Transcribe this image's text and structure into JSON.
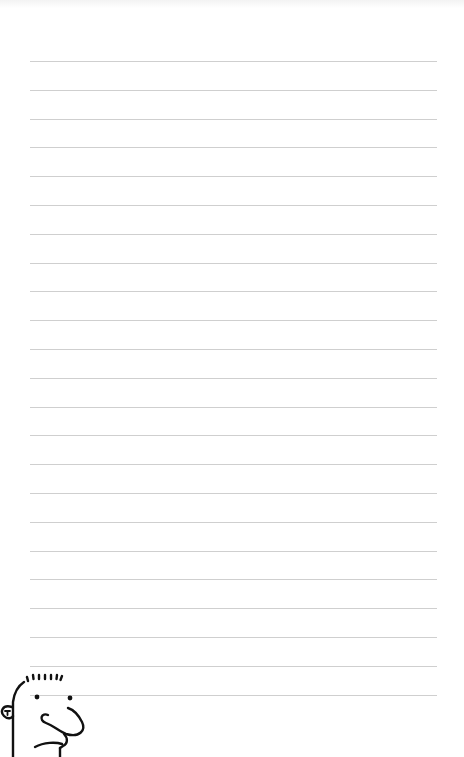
{
  "page": {
    "type": "ruled-notebook-page",
    "background_color": "#ffffff",
    "rule_color": "#cfcfcf",
    "rules": {
      "count": 23,
      "first_y": 61,
      "spacing": 28.8,
      "left_x": 30,
      "right_x": 437
    }
  },
  "doodle": {
    "label": "cartoon-face",
    "position": "bottom-left",
    "stroke_color": "#111111"
  }
}
